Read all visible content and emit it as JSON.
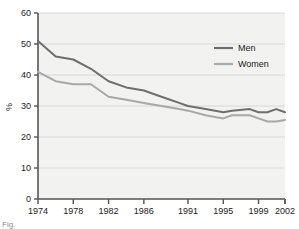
{
  "chart_data": {
    "type": "line",
    "title": "",
    "xlabel": "",
    "ylabel": "%",
    "ylim": [
      0,
      60
    ],
    "ytick_values": [
      0,
      10,
      20,
      30,
      40,
      50,
      60
    ],
    "ytick_labels": [
      "0",
      "10",
      "20",
      "30",
      "40",
      "50",
      "60"
    ],
    "xtick_labels": [
      "1974",
      "1978",
      "1982",
      "1986",
      "1991",
      "1995",
      "1999",
      "2002"
    ],
    "xtick_values": [
      1974,
      1978,
      1982,
      1986,
      1991,
      1995,
      1999,
      2002
    ],
    "xlim": [
      1974,
      2002
    ],
    "grid": "horizontal",
    "legend_position": "upper right",
    "x": [
      1974,
      1976,
      1978,
      1980,
      1982,
      1984,
      1986,
      1988,
      1990,
      1991,
      1993,
      1995,
      1996,
      1998,
      1999,
      2000,
      2001,
      2002
    ],
    "series": [
      {
        "name": "Men",
        "color": "#6e6e6e",
        "values": [
          51.0,
          46.0,
          45.0,
          42.0,
          38.0,
          36.0,
          35.0,
          33.0,
          31.0,
          30.0,
          29.0,
          28.0,
          28.5,
          29.0,
          28.0,
          28.0,
          29.0,
          28.0
        ]
      },
      {
        "name": "Women",
        "color": "#a8a8a8",
        "values": [
          41.0,
          38.0,
          37.0,
          37.0,
          33.0,
          32.0,
          31.0,
          30.0,
          29.0,
          28.5,
          27.0,
          26.0,
          27.0,
          27.0,
          26.0,
          25.0,
          25.0,
          25.5
        ]
      }
    ]
  },
  "legend": {
    "items": [
      {
        "label": "Men",
        "color": "#6e6e6e"
      },
      {
        "label": "Women",
        "color": "#a8a8a8"
      }
    ]
  },
  "axes": {
    "y_title": "%"
  },
  "caption": {
    "text": "Fig."
  }
}
